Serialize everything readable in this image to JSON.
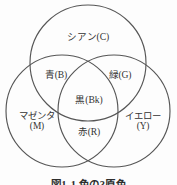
{
  "figure": {
    "caption": "図1-1 色の3原色",
    "background_color": "#fdfdfd",
    "stroke_color": "#565656",
    "text_color": "#333333"
  },
  "diagram": {
    "type": "venn-3-circle",
    "circles": [
      {
        "id": "cyan",
        "label": "シアン(C)",
        "cx": 88,
        "cy": 63,
        "r": 58
      },
      {
        "id": "magenta",
        "label": "マゼンタ\n(M)",
        "cx": 62,
        "cy": 109,
        "r": 56
      },
      {
        "id": "yellow",
        "label": "イエロー\n(Y)",
        "cx": 115,
        "cy": 109,
        "r": 56
      }
    ],
    "regions": [
      {
        "id": "cyan",
        "label": "シアン(C)",
        "lines": [
          "シアン(C)"
        ]
      },
      {
        "id": "magenta",
        "label": "マゼンタ(M)",
        "lines": [
          "マゼンタ",
          "(M)"
        ]
      },
      {
        "id": "yellow",
        "label": "イエロー(Y)",
        "lines": [
          "イエロー",
          "(Y)"
        ]
      },
      {
        "id": "blue",
        "label": "青(B)",
        "lines": [
          "青(B)"
        ]
      },
      {
        "id": "green",
        "label": "緑(G)",
        "lines": [
          "緑(G)"
        ]
      },
      {
        "id": "red",
        "label": "赤(R)",
        "lines": [
          "赤(R)"
        ]
      },
      {
        "id": "black",
        "label": "黒(Bk)",
        "lines": [
          "黒(Bk)"
        ]
      }
    ],
    "labels": {
      "cyan": "シアン(C)",
      "blue": "青(B)",
      "green": "緑(G)",
      "black": "黒(Bk)",
      "magenta_line1": "マゼンタ",
      "magenta_line2": "(M)",
      "yellow_line1": "イエロー",
      "yellow_line2": "(Y)",
      "red": "赤(R)"
    }
  }
}
